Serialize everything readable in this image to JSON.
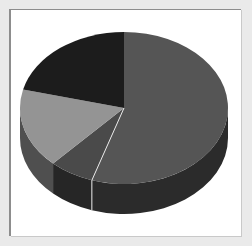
{
  "chart_data": {
    "type": "pie",
    "title": "",
    "subtitle": "",
    "xlabel": "",
    "ylabel": "",
    "legend": false,
    "legend_position": "none",
    "grid": false,
    "three_d": true,
    "start_angle_deg": 0,
    "direction": "clockwise",
    "labels": [
      "Slice 1",
      "Slice 2",
      "Slice 3",
      "Slice 4"
    ],
    "values": [
      55,
      7,
      17,
      21
    ],
    "units": "percent",
    "slices": [
      {
        "name": "Slice 1",
        "value": 55,
        "start_deg": 0,
        "end_deg": 198,
        "top_color": "#555555",
        "side_color": "#2b2b2b"
      },
      {
        "name": "Slice 2",
        "value": 7,
        "start_deg": 198,
        "end_deg": 223,
        "top_color": "#4a4a4a",
        "side_color": "#262626"
      },
      {
        "name": "Slice 3",
        "value": 17,
        "start_deg": 223,
        "end_deg": 284,
        "top_color": "#949494",
        "side_color": "#4f4f4f"
      },
      {
        "name": "Slice 4",
        "value": 21,
        "start_deg": 284,
        "end_deg": 360,
        "top_color": "#1c1c1c",
        "side_color": "#111111"
      }
    ],
    "separator_color": "#e6e6e6",
    "separator_width": 1
  },
  "figure": {
    "background_color": "#ffffff",
    "page_background_color": "#eaeaea",
    "border_color": "#8d8d8d"
  }
}
